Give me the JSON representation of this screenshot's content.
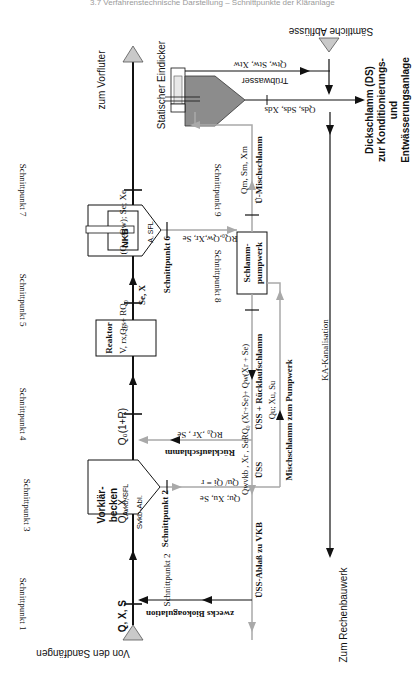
{
  "header_fragment": "3.7 Verfahrenstechnische Darstellung – Schnittpunkte der Kläranlage",
  "colors": {
    "line_main": "#111111",
    "line_grey": "#a9a9a9",
    "thickener_fill": "#8c8c8c",
    "arrow_fill": "#c9c9c9"
  },
  "inlets": {
    "sand": "Von den Sandfängen",
    "all_drains": "Sämtliche Abflüsse"
  },
  "outlets": {
    "receiving_water": "zum Vorfluter",
    "screen_building": "Zum Rechenbauwerk",
    "thick_sludge_line1": "Dickschlamm (DS)",
    "thick_sludge_line2": "zur Konditionierungs-",
    "thick_sludge_line3": "und",
    "thick_sludge_line4": "Entwässerungsanlage"
  },
  "units": {
    "primary_clarifier": {
      "line1": "Vorklär-",
      "line2": "becken",
      "line3": "Avkb, SFL"
    },
    "reactor": {
      "line1": "Reaktor",
      "line2": "V, rx, -rs"
    },
    "secondary_clarifier": {
      "line1": "NKB",
      "line2": "A, SFL"
    },
    "sludge_pump": {
      "line1": "Schlamm-",
      "line2": "pumpwerk"
    },
    "thickener": "Statischer Eindicker"
  },
  "schnittpunkte": [
    "Schnittpunkt 1",
    "Schnittpunkt 2",
    "Schnittpunkt 3",
    "Schnittpunkt 4",
    "Schnittpunkt 5",
    "Schnittpunkt 6",
    "Schnittpunkt 7",
    "Schnittpunkt 8",
    "Schnittpunkt 9"
  ],
  "flow_labels": {
    "qxs": "Q, X, S",
    "q0x0": "Q₀, X₀",
    "svkb": "Svkb-Abl.",
    "q0_1r": "Q₀(1+R)",
    "reactor_out": "Q₀ + RQ₀",
    "se_x": "Se, X",
    "effluent": "(Q₀ –Qw); Se; Xe",
    "nkb_out": "RQ₀,Qw,Xr, Se",
    "return_sludge_vals": "RQ₀ ,Xr , Se",
    "return_sludge": "Rücklaufschlamm",
    "return_plus": "RQ₀ (Xr+Se)+ Qw(Xr + Se)",
    "uess_return": "ÜSS + Rücklaufschlamm",
    "qu_xu": "Qu; Xu, Su",
    "qwvkb": "Qwvkb , Xr , Se",
    "uess": "ÜSS",
    "uess_outlet": "ÜSS-Ablaß zu VKB",
    "qu_ratio": "Qu/ Qi = r",
    "qu_xu_se": "Qu; Xu, Se",
    "mixed_to_pump": "Mischschlamm zum Pumpwerk",
    "qm": "Qm, Sm, Xm",
    "u_mixed": "Ü-Mischschlamm",
    "truebwasser": "Trübwasser",
    "qtw": "Qtw, Stw, Xtw",
    "qds": "Qds, Sds, Xds",
    "ka_kanal": "KA-Kanalisation",
    "biocoag": "zwecks Biokoagulation"
  }
}
